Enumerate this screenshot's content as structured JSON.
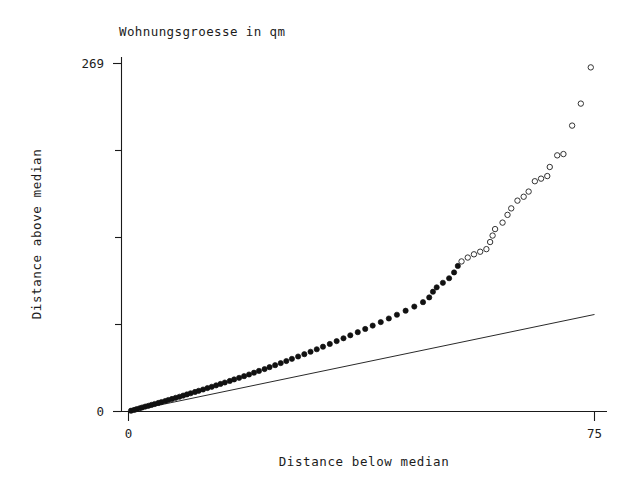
{
  "chart_data": {
    "type": "scatter",
    "title": "Wohnungsgroesse in qm",
    "xlabel": "Distance below median",
    "ylabel": "Distance above median",
    "xlim": [
      0,
      75
    ],
    "ylim": [
      0,
      269
    ],
    "xticks": [
      "0",
      "75"
    ],
    "yticks": [
      "0",
      "269"
    ],
    "grid": false,
    "legend": null,
    "annotations": [],
    "reference_line": {
      "description": "y = x identity line",
      "x": [
        0,
        75
      ],
      "y": [
        0,
        75
      ]
    },
    "marker_note": "filled circles for lower/dense points, open circles for upper tail points",
    "points": [
      {
        "x": 0.4,
        "y": 0.6,
        "marker": "filled"
      },
      {
        "x": 0.9,
        "y": 1.2,
        "marker": "filled"
      },
      {
        "x": 1.3,
        "y": 1.8,
        "marker": "filled"
      },
      {
        "x": 1.8,
        "y": 2.5,
        "marker": "filled"
      },
      {
        "x": 2.2,
        "y": 3.1,
        "marker": "filled"
      },
      {
        "x": 2.7,
        "y": 3.8,
        "marker": "filled"
      },
      {
        "x": 3.2,
        "y": 4.4,
        "marker": "filled"
      },
      {
        "x": 3.7,
        "y": 5.1,
        "marker": "filled"
      },
      {
        "x": 4.2,
        "y": 5.8,
        "marker": "filled"
      },
      {
        "x": 4.8,
        "y": 6.6,
        "marker": "filled"
      },
      {
        "x": 5.3,
        "y": 7.3,
        "marker": "filled"
      },
      {
        "x": 5.9,
        "y": 8.1,
        "marker": "filled"
      },
      {
        "x": 6.4,
        "y": 8.9,
        "marker": "filled"
      },
      {
        "x": 7.0,
        "y": 9.7,
        "marker": "filled"
      },
      {
        "x": 7.6,
        "y": 10.6,
        "marker": "filled"
      },
      {
        "x": 8.2,
        "y": 11.4,
        "marker": "filled"
      },
      {
        "x": 8.8,
        "y": 12.3,
        "marker": "filled"
      },
      {
        "x": 9.4,
        "y": 13.2,
        "marker": "filled"
      },
      {
        "x": 10.0,
        "y": 14.1,
        "marker": "filled"
      },
      {
        "x": 10.7,
        "y": 15.1,
        "marker": "filled"
      },
      {
        "x": 11.3,
        "y": 16.0,
        "marker": "filled"
      },
      {
        "x": 12.0,
        "y": 17.0,
        "marker": "filled"
      },
      {
        "x": 12.7,
        "y": 18.1,
        "marker": "filled"
      },
      {
        "x": 13.4,
        "y": 19.1,
        "marker": "filled"
      },
      {
        "x": 14.1,
        "y": 20.2,
        "marker": "filled"
      },
      {
        "x": 14.8,
        "y": 21.3,
        "marker": "filled"
      },
      {
        "x": 15.5,
        "y": 22.4,
        "marker": "filled"
      },
      {
        "x": 16.3,
        "y": 23.6,
        "marker": "filled"
      },
      {
        "x": 17.0,
        "y": 24.8,
        "marker": "filled"
      },
      {
        "x": 17.8,
        "y": 26.0,
        "marker": "filled"
      },
      {
        "x": 18.6,
        "y": 27.3,
        "marker": "filled"
      },
      {
        "x": 19.4,
        "y": 28.6,
        "marker": "filled"
      },
      {
        "x": 20.2,
        "y": 30.0,
        "marker": "filled"
      },
      {
        "x": 21.0,
        "y": 31.4,
        "marker": "filled"
      },
      {
        "x": 21.9,
        "y": 32.8,
        "marker": "filled"
      },
      {
        "x": 22.7,
        "y": 34.3,
        "marker": "filled"
      },
      {
        "x": 23.6,
        "y": 35.8,
        "marker": "filled"
      },
      {
        "x": 24.5,
        "y": 37.4,
        "marker": "filled"
      },
      {
        "x": 25.4,
        "y": 39.0,
        "marker": "filled"
      },
      {
        "x": 26.3,
        "y": 40.7,
        "marker": "filled"
      },
      {
        "x": 27.3,
        "y": 42.5,
        "marker": "filled"
      },
      {
        "x": 28.3,
        "y": 44.3,
        "marker": "filled"
      },
      {
        "x": 29.3,
        "y": 46.2,
        "marker": "filled"
      },
      {
        "x": 30.3,
        "y": 48.1,
        "marker": "filled"
      },
      {
        "x": 31.3,
        "y": 50.1,
        "marker": "filled"
      },
      {
        "x": 32.4,
        "y": 52.2,
        "marker": "filled"
      },
      {
        "x": 33.5,
        "y": 54.4,
        "marker": "filled"
      },
      {
        "x": 34.6,
        "y": 56.6,
        "marker": "filled"
      },
      {
        "x": 35.7,
        "y": 58.9,
        "marker": "filled"
      },
      {
        "x": 36.9,
        "y": 61.3,
        "marker": "filled"
      },
      {
        "x": 38.1,
        "y": 63.8,
        "marker": "filled"
      },
      {
        "x": 39.3,
        "y": 66.4,
        "marker": "filled"
      },
      {
        "x": 40.6,
        "y": 69.1,
        "marker": "filled"
      },
      {
        "x": 41.9,
        "y": 71.9,
        "marker": "filled"
      },
      {
        "x": 43.2,
        "y": 74.8,
        "marker": "filled"
      },
      {
        "x": 44.6,
        "y": 77.9,
        "marker": "filled"
      },
      {
        "x": 46.0,
        "y": 81.1,
        "marker": "filled"
      },
      {
        "x": 47.4,
        "y": 84.5,
        "marker": "filled"
      },
      {
        "x": 48.4,
        "y": 88.2,
        "marker": "filled"
      },
      {
        "x": 49.0,
        "y": 92.6,
        "marker": "filled"
      },
      {
        "x": 49.6,
        "y": 96.0,
        "marker": "filled"
      },
      {
        "x": 50.6,
        "y": 99.5,
        "marker": "filled"
      },
      {
        "x": 51.6,
        "y": 103.0,
        "marker": "filled"
      },
      {
        "x": 52.4,
        "y": 107.5,
        "marker": "filled"
      },
      {
        "x": 53.0,
        "y": 112.5,
        "marker": "filled"
      },
      {
        "x": 53.6,
        "y": 116.0,
        "marker": "open"
      },
      {
        "x": 54.6,
        "y": 119.0,
        "marker": "open"
      },
      {
        "x": 55.6,
        "y": 121.5,
        "marker": "open"
      },
      {
        "x": 56.6,
        "y": 123.5,
        "marker": "open"
      },
      {
        "x": 57.6,
        "y": 125.5,
        "marker": "open"
      },
      {
        "x": 58.2,
        "y": 131.0,
        "marker": "open"
      },
      {
        "x": 58.6,
        "y": 136.0,
        "marker": "open"
      },
      {
        "x": 59.0,
        "y": 141.0,
        "marker": "open"
      },
      {
        "x": 60.2,
        "y": 146.0,
        "marker": "open"
      },
      {
        "x": 61.0,
        "y": 152.0,
        "marker": "open"
      },
      {
        "x": 61.6,
        "y": 157.0,
        "marker": "open"
      },
      {
        "x": 62.6,
        "y": 163.0,
        "marker": "open"
      },
      {
        "x": 63.6,
        "y": 166.0,
        "marker": "open"
      },
      {
        "x": 64.4,
        "y": 170.0,
        "marker": "open"
      },
      {
        "x": 65.4,
        "y": 178.0,
        "marker": "open"
      },
      {
        "x": 66.4,
        "y": 180.0,
        "marker": "open"
      },
      {
        "x": 67.4,
        "y": 182.0,
        "marker": "open"
      },
      {
        "x": 67.8,
        "y": 189.0,
        "marker": "open"
      },
      {
        "x": 69.0,
        "y": 198.0,
        "marker": "open"
      },
      {
        "x": 70.0,
        "y": 199.0,
        "marker": "open"
      },
      {
        "x": 71.4,
        "y": 221.0,
        "marker": "open"
      },
      {
        "x": 72.8,
        "y": 238.0,
        "marker": "open"
      },
      {
        "x": 74.4,
        "y": 266.0,
        "marker": "open"
      }
    ]
  },
  "colors": {
    "background": "#ffffff",
    "axis": "#1a1a1a",
    "text": "#1c1c1c",
    "marker_filled": "#111111",
    "marker_open_stroke": "#333333",
    "reference_line": "#2a2a2a"
  }
}
